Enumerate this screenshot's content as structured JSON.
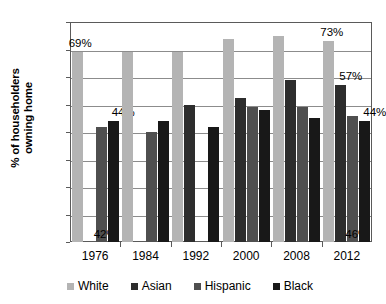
{
  "chart_data": {
    "type": "bar",
    "title": "",
    "xlabel": "",
    "ylabel": "% of householders owning home",
    "ylabel_line1": "% of householders",
    "ylabel_line2": "owning home",
    "ylim": [
      0,
      80
    ],
    "ytick_labels": [
      "80%",
      "70%",
      "60%",
      "50%",
      "40%",
      "30%",
      "20%",
      "10%",
      "0%"
    ],
    "ytick_values": [
      80,
      70,
      60,
      50,
      40,
      30,
      20,
      10,
      0
    ],
    "grid": true,
    "legend_position": "bottom",
    "categories": [
      "1976",
      "1984",
      "1992",
      "2000",
      "2008",
      "2012"
    ],
    "series": [
      {
        "name": "White",
        "color": "#b4b4b4",
        "values": [
          69,
          69,
          69,
          74,
          75,
          73
        ]
      },
      {
        "name": "Asian",
        "color": "#2d2d2d",
        "values": [
          null,
          null,
          50,
          52.5,
          59,
          57
        ]
      },
      {
        "name": "Hispanic",
        "color": "#4f4f4f",
        "values": [
          42,
          40,
          null,
          49,
          49,
          46
        ]
      },
      {
        "name": "Black",
        "color": "#181818",
        "values": [
          44,
          44,
          42,
          48,
          45,
          44
        ]
      }
    ],
    "annotations": [
      {
        "text": "69%",
        "series": "White",
        "category": "1976"
      },
      {
        "text": "44%",
        "series": "Black",
        "category": "1976"
      },
      {
        "text": "42%",
        "series": "Hispanic",
        "category": "1976"
      },
      {
        "text": "73%",
        "series": "White",
        "category": "2012"
      },
      {
        "text": "57%",
        "series": "Asian",
        "category": "2012"
      },
      {
        "text": "44%",
        "series": "Black",
        "category": "2012"
      },
      {
        "text": "46%",
        "series": "Hispanic",
        "category": "2012"
      }
    ]
  },
  "legend": {
    "items": [
      {
        "label": "White"
      },
      {
        "label": "Asian"
      },
      {
        "label": "Hispanic"
      },
      {
        "label": "Black"
      }
    ]
  }
}
